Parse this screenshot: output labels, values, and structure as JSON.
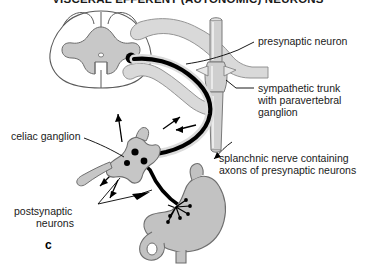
{
  "figure": {
    "title": "VISCERAL EFFERENT (AUTONOMIC) NEURONS",
    "panel_letter": "c",
    "background_color": "#ffffff",
    "gray_fill_color": "#c8c8c8",
    "light_gray_fill_color": "#d9d9d9",
    "outline_color": "#4d4d4d",
    "nerve_color": "#000000",
    "text_color": "#1a1a1a"
  },
  "labels": {
    "presynaptic_neuron": "presynaptic neuron",
    "sympathetic_trunk_line1": "sympathetic trunk",
    "sympathetic_trunk_line2": "with paravertebral",
    "sympathetic_trunk_line3": "ganglion",
    "splanchnic_nerve_line1": "splanchnic nerve containing",
    "splanchnic_nerve_line2": "axons of presynaptic neurons",
    "celiac_ganglion": "celiac ganglion",
    "postsynaptic_line1": "postsynaptic",
    "postsynaptic_line2": "neurons"
  },
  "structures": {
    "spinal_cord": "spinal-cord-cross-section",
    "gray_matter": "butterfly-gray-matter",
    "cell_body": "presynaptic-cell-body",
    "sympathetic_trunk": "sympathetic-trunk-tube",
    "paravertebral_ganglion": "paravertebral-ganglion",
    "splanchnic_nerve": "splanchnic-nerve-fiber",
    "celiac_ganglion": "celiac-ganglion-body",
    "postsynaptic_cell_bodies": "postsynaptic-cell-bodies",
    "stomach": "stomach-organ",
    "duodenum": "duodenum",
    "nerve_terminals": "nerve-terminal-branches"
  }
}
